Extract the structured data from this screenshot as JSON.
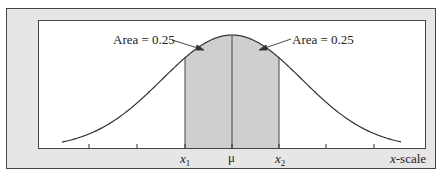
{
  "figure": {
    "labels": {
      "left_area": "Area = 0.25",
      "right_area": "Area = 0.25",
      "x1": "x",
      "x1_sub": "1",
      "mu": "μ",
      "x2": "x",
      "x2_sub": "2",
      "axis": "-scale",
      "axis_var": "x"
    },
    "colors": {
      "frame_bg": "#e6e6e6",
      "plot_bg": "#ffffff",
      "shade": "#cfcfcf",
      "line": "#3a3a3a"
    }
  },
  "chart_data": {
    "type": "area",
    "title": "",
    "xlabel": "x-scale",
    "ylabel": "",
    "x_tick_labels": [
      "",
      "",
      "x1",
      "μ",
      "x2",
      "",
      ""
    ],
    "shaded_regions": [
      {
        "from": "x1",
        "to": "μ",
        "area": 0.25
      },
      {
        "from": "μ",
        "to": "x2",
        "area": 0.25
      }
    ],
    "annotations": [
      "Area = 0.25",
      "Area = 0.25"
    ],
    "grid": false
  }
}
